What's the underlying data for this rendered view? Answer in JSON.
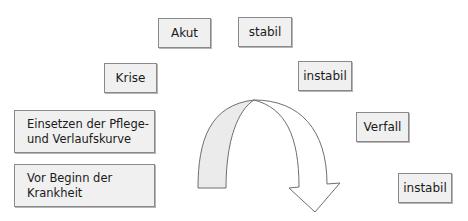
{
  "diagram": {
    "phases": [
      {
        "id": "vor-beginn",
        "label_lines": [
          "Vor Beginn der",
          "Krankheit"
        ]
      },
      {
        "id": "einsetzen",
        "label_lines": [
          "Einsetzen der Pflege-",
          "und Verlaufskurve"
        ]
      },
      {
        "id": "krise",
        "label": "Krise"
      },
      {
        "id": "akut",
        "label": "Akut"
      },
      {
        "id": "stabil",
        "label": "stabil"
      },
      {
        "id": "instabil-1",
        "label": "instabil"
      },
      {
        "id": "verfall",
        "label": "Verfall"
      },
      {
        "id": "instabil-2",
        "label": "instabil"
      }
    ],
    "arrow": {
      "shape": "curved-arch-arrow",
      "direction": "left-to-right-downward",
      "fill": "#ffffff",
      "shaded_left_fill": "#ebebeb",
      "stroke": "#6e6e6e"
    },
    "colors": {
      "box_fill": "#f0f0f0",
      "box_border": "#8a8a8a",
      "text": "#1a1a1a"
    }
  }
}
